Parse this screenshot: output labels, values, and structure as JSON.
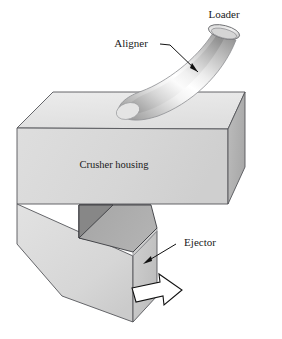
{
  "figure": {
    "type": "technical-line-diagram",
    "background_color": "#ffffff",
    "width": 282,
    "height": 339
  },
  "labels": {
    "loader": "Loader",
    "aligner": "Aligner",
    "crusher_housing": "Crusher housing",
    "ejector": "Ejector"
  },
  "parts": [
    {
      "name": "loader",
      "label": "Loader",
      "shape": "ellipse-opening",
      "description": "Circular intake opening at the top of the curved aligner tube"
    },
    {
      "name": "aligner",
      "label": "Aligner",
      "shape": "curved-tube",
      "description": "Curved banana-shaped tube descending from the loader onto the crusher housing top face"
    },
    {
      "name": "crusher-housing",
      "label": "Crusher housing",
      "shape": "rectangular-prism",
      "description": "Large three-dimensional box forming the body of the crusher"
    },
    {
      "name": "ejector",
      "label": "Ejector",
      "shape": "recessed-chute",
      "description": "Darkly shaded recessed chute beneath the housing that discharges crushed material"
    },
    {
      "name": "discharge-arrow",
      "label": "",
      "shape": "block-arrow",
      "description": "Hollow white block arrow indicating the direction of material discharge"
    }
  ],
  "colors": {
    "top_face": "#e9e9e9",
    "front_face": "#d9d9d9",
    "right_face": "#b4b4b4",
    "hopper_front": "#dcdcdc",
    "hopper_side": "#c4c4c4",
    "chute_dark": "#8f8f8f",
    "chute_mid": "#a8a8a8",
    "outline": "#55565a",
    "text": "#1a1a1a",
    "arrow_fill": "#ffffff",
    "arrow_outline": "#111111"
  },
  "leader_lines": [
    {
      "name": "aligner-leader",
      "from": "Aligner label",
      "to": "curved tube mid-body"
    },
    {
      "name": "ejector-leader",
      "from": "Ejector label",
      "to": "chute discharge edge"
    }
  ]
}
